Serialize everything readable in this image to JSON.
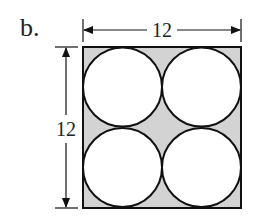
{
  "figure": {
    "label": "b.",
    "width_label": "12",
    "height_label": "12",
    "colors": {
      "stroke": "#111111",
      "shaded": "#d3d3d3",
      "circle_fill": "#ffffff"
    },
    "circles": [
      {
        "position": "top-left"
      },
      {
        "position": "top-right"
      },
      {
        "position": "bottom-left"
      },
      {
        "position": "bottom-right"
      }
    ]
  }
}
